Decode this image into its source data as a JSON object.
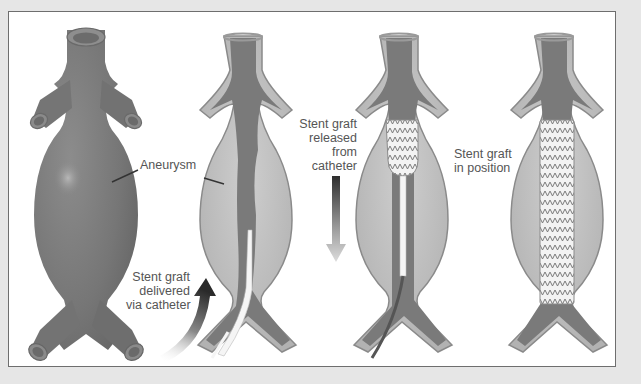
{
  "diagram": {
    "colors": {
      "background": "#e6e6e6",
      "frame_fill": "#ffffff",
      "frame_border": "#6e6e6e",
      "vessel": "#7d7d7d",
      "vessel_dark": "#676767",
      "vessel_wall": "#b5b5b5",
      "aneurysm_sac": "#c2c2c2",
      "stent_fill": "#f2f2f2",
      "stent_wire": "#808080",
      "catheter": "#f4f4f4",
      "label_text": "#555555"
    },
    "panels": [
      {
        "id": "panel-1",
        "description": "Intact aorta with aneurysm (external view)"
      },
      {
        "id": "panel-2",
        "description": "Cutaway aorta, stent graft delivered via catheter"
      },
      {
        "id": "panel-3",
        "description": "Stent graft released from catheter"
      },
      {
        "id": "panel-4",
        "description": "Stent graft in position"
      }
    ],
    "labels": {
      "aneurysm": "Aneurysm",
      "delivered": [
        "Stent graft",
        "delivered",
        "via catheter"
      ],
      "released": [
        "Stent graft",
        "released",
        "from",
        "catheter"
      ],
      "in_position": [
        "Stent graft",
        "in position"
      ]
    }
  }
}
